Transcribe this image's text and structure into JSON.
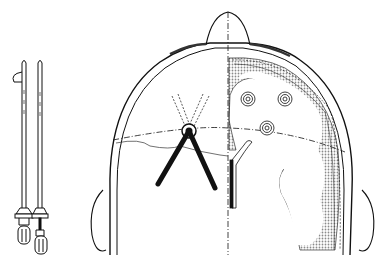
{
  "figure": {
    "colors": {
      "line": "#111111",
      "cortex_shade": "#9a9a9a",
      "background": "#ffffff"
    },
    "instruments": [
      {
        "name": "catheter-with-stylet-loop"
      },
      {
        "name": "catheter-with-stylet-inserted"
      }
    ],
    "targets_count": 3
  }
}
